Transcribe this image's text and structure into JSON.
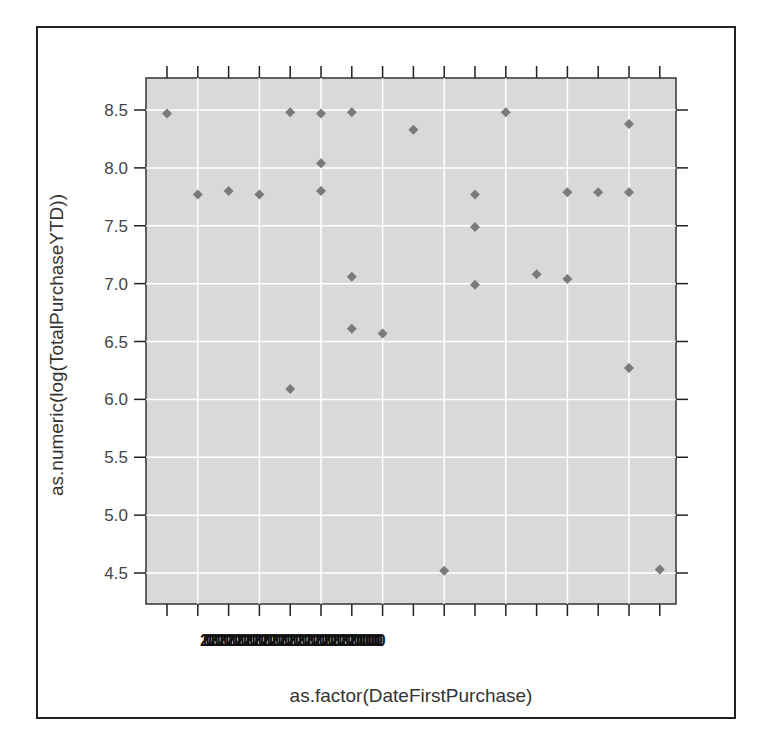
{
  "chart_data": {
    "type": "scatter",
    "title": "",
    "xlabel": "as.factor(DateFirstPurchase)",
    "ylabel": "as.numeric(log(TotalPurchaseYTD))",
    "ylim": [
      4.2,
      8.75
    ],
    "yticks": [
      4.5,
      5.0,
      5.5,
      6.0,
      6.5,
      7.0,
      7.5,
      8.0,
      8.5
    ],
    "ytick_labels": [
      "4.5",
      "5.0",
      "5.5",
      "6.0",
      "6.5",
      "7.0",
      "7.5",
      "8.0",
      "8.5"
    ],
    "x_tick_label_text": "2002002002002002002002002002002002002002002002002002000000000",
    "x_tick_labels_note": "overlapping illegible date labels; leading '200' visible",
    "x_categories_count": 17,
    "grid": true,
    "background": "#d9d9d9",
    "point_color": "#7a7a7a",
    "marker": "diamond",
    "points": [
      {
        "x": 0,
        "y": 8.47
      },
      {
        "x": 1,
        "y": 7.77
      },
      {
        "x": 2,
        "y": 7.8
      },
      {
        "x": 3,
        "y": 7.77
      },
      {
        "x": 4,
        "y": 8.48
      },
      {
        "x": 4,
        "y": 6.09
      },
      {
        "x": 5,
        "y": 8.47
      },
      {
        "x": 5,
        "y": 8.04
      },
      {
        "x": 5,
        "y": 7.8
      },
      {
        "x": 6,
        "y": 8.48
      },
      {
        "x": 6,
        "y": 7.06
      },
      {
        "x": 6,
        "y": 6.61
      },
      {
        "x": 7,
        "y": 6.57
      },
      {
        "x": 8,
        "y": 8.33
      },
      {
        "x": 9,
        "y": 4.52
      },
      {
        "x": 10,
        "y": 7.77
      },
      {
        "x": 10,
        "y": 7.49
      },
      {
        "x": 10,
        "y": 6.99
      },
      {
        "x": 11,
        "y": 8.48
      },
      {
        "x": 12,
        "y": 7.08
      },
      {
        "x": 13,
        "y": 7.79
      },
      {
        "x": 13,
        "y": 7.04
      },
      {
        "x": 14,
        "y": 7.79
      },
      {
        "x": 15,
        "y": 8.38
      },
      {
        "x": 15,
        "y": 7.79
      },
      {
        "x": 15,
        "y": 6.27
      },
      {
        "x": 16,
        "y": 4.53
      }
    ]
  },
  "labels": {
    "x_axis": "as.factor(DateFirstPurchase)",
    "y_axis": "as.numeric(log(TotalPurchaseYTD))",
    "x_ticks_text": "20020020020020020020020020020020020020020020020020020000000000"
  }
}
